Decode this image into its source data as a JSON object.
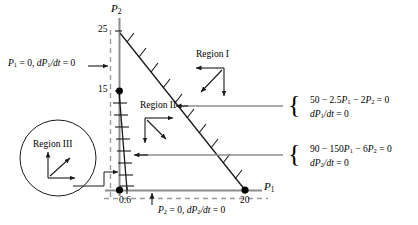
{
  "figure": {
    "axes": {
      "x_label": "P1",
      "y_label": "P2",
      "x_ticks": [
        {
          "value": 0.6,
          "label": "0.6"
        },
        {
          "value": 20,
          "label": "20"
        }
      ],
      "y_ticks": [
        {
          "value": 15,
          "label": "15"
        },
        {
          "value": 25,
          "label": "25"
        }
      ]
    },
    "regions": [
      {
        "id": "region-1",
        "label": "Region I",
        "arrows": [
          "left",
          "down-left",
          "down"
        ]
      },
      {
        "id": "region-2",
        "label": "Region II",
        "arrows": [
          "right",
          "down-right",
          "down"
        ]
      },
      {
        "id": "region-3",
        "label": "Region III",
        "arrows": [
          "up",
          "up-right",
          "right"
        ],
        "circled": true
      }
    ],
    "left_label": {
      "text": "P1 = 0, dP1/dt = 0",
      "parts": [
        "P",
        "1",
        " = 0, ",
        "d",
        "P",
        "1",
        "/",
        "dt",
        " = 0"
      ]
    },
    "bottom_label": {
      "text": "P2 = 0, dP2/dt = 0"
    },
    "right_labels": [
      {
        "id": "isocline-p1",
        "line1": "50 − 2.5P1 − 2P2 = 0",
        "line2": "dP1/dt = 0"
      },
      {
        "id": "isocline-p2",
        "line1": "90 − 150P1 − 6P2 = 0",
        "line2": "dP2/dt = 0"
      }
    ],
    "curves": [
      {
        "id": "isocline-p1-line",
        "from": [
          0,
          25
        ],
        "to": [
          20,
          0
        ],
        "hatched": true
      },
      {
        "id": "isocline-p2-line",
        "from": [
          0,
          15
        ],
        "to": [
          0.6,
          0
        ],
        "hatched": true
      }
    ],
    "points": [
      {
        "id": "point-0-15",
        "x": 0,
        "y": 15
      },
      {
        "id": "point-origin",
        "x": 0,
        "y": 0
      },
      {
        "id": "point-20-0",
        "x": 20,
        "y": 0
      }
    ],
    "colors": {
      "line": "#000000",
      "axis": "#808080",
      "dashed": "#8a8a8a",
      "background": "#ffffff"
    }
  }
}
